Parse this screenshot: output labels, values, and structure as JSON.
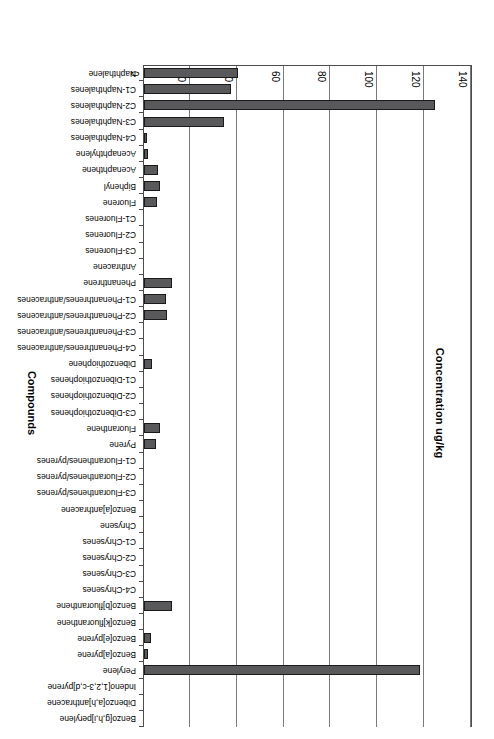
{
  "chart_data": {
    "type": "bar",
    "orientation": "horizontal",
    "title": "",
    "xlabel": "Concentration ug/kg",
    "ylabel": "Compounds",
    "xlim": [
      0,
      140
    ],
    "xticks": [
      0,
      20,
      40,
      60,
      80,
      100,
      120,
      140
    ],
    "grid": true,
    "legend": "none",
    "bar_color": "#59595b",
    "categories": [
      "Naphthalene",
      "C1-Naphthalenes",
      "C2-Naphthalenes",
      "C3-Naphthalenes",
      "C4-Naphthalenes",
      "Acenaphthylene",
      "Acenaphthene",
      "Biphenyl",
      "Fluorene",
      "C1-Fluorenes",
      "C2-Fluorenes",
      "C3-Fluorenes",
      "Anthracene",
      "Phenanthrene",
      "C1-Phenanthrenes/anthracenes",
      "C2-Phenanthrenes/anthracenes",
      "C3-Phenanthrenes/anthracenes",
      "C4-Phenanthrenes/anthracenes",
      "Dibenzothiophene",
      "C1-Dibenzothiophenes",
      "C2-Dibenzothiophenes",
      "C3-Dibenzothiophenes",
      "Fluoranthene",
      "Pyrene",
      "C1-Fluoranthenes/pyrenes",
      "C2-Fluoranthenes/pyrenes",
      "C3-Fluoranthenes/pyrenes",
      "Benzo[a]anthracene",
      "Chrysene",
      "C1-Chrysenes",
      "C2-Chrysenes",
      "C3-Chrysenes",
      "C4-Chrysenes",
      "Benzo[b]fluoranthene",
      "Benzo[k]fluoranthene",
      "Benzo[e]pyrene",
      "Benzo[a]pyrene",
      "Perylene",
      "Indeno[1,2,3-c,d]pyrene",
      "Dibenzo[a,h]anthracene",
      "Benzo[g,h,i]perylene"
    ],
    "values": [
      40,
      37,
      124,
      34,
      1,
      1.5,
      6,
      7,
      5.5,
      0,
      0,
      0,
      0,
      12,
      9.5,
      10,
      0,
      0,
      3.5,
      0,
      0,
      0,
      7,
      5,
      0,
      0,
      0,
      0,
      0,
      0,
      0,
      0,
      0,
      12,
      0,
      3,
      1.5,
      118,
      0,
      0,
      0
    ]
  }
}
